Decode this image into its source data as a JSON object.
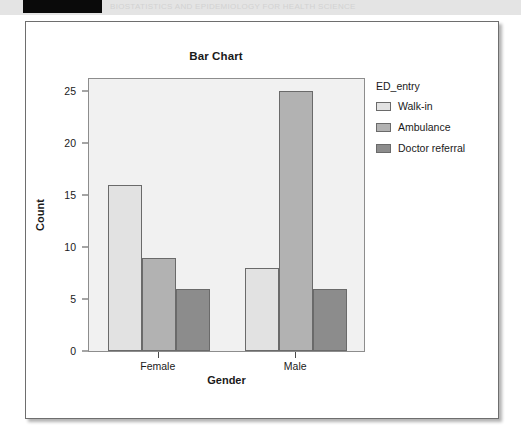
{
  "top_strip": {
    "redaction_label": "",
    "faint_text": "BIOSTATISTICS  AND  EPIDEMIOLOGY  FOR  HEALTH  SCIENCE"
  },
  "chart_data": {
    "type": "bar",
    "title": "Bar Chart",
    "xlabel": "Gender",
    "ylabel": "Count",
    "categories": [
      "Female",
      "Male"
    ],
    "series": [
      {
        "name": "Walk-in",
        "values": [
          16,
          8
        ],
        "color": "#e2e2e2"
      },
      {
        "name": "Ambulance",
        "values": [
          9,
          25
        ],
        "color": "#b2b2b2"
      },
      {
        "name": "Doctor referral",
        "values": [
          6,
          6
        ],
        "color": "#8c8c8c"
      }
    ],
    "legend_title": "ED_entry",
    "legend_position": "right",
    "ylim": [
      0,
      26.2
    ],
    "yticks": [
      0,
      5,
      10,
      15,
      20,
      25
    ],
    "ytick_labels": [
      "0",
      "5",
      "10",
      "15",
      "20",
      "25"
    ],
    "grid": false,
    "panel_color": "#f1f1f1",
    "bar_edge_color": "#6a6a6a"
  }
}
